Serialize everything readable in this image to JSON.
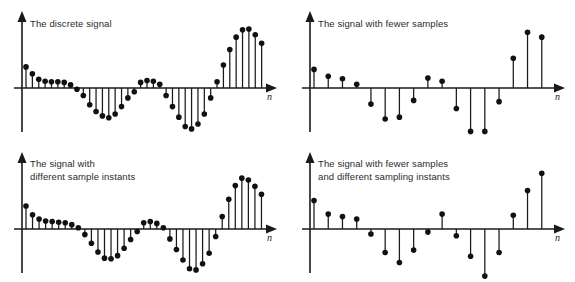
{
  "figure": {
    "background": "#ffffff",
    "stroke_color": "#1a1a1a",
    "marker_color": "#111111",
    "text_color": "#2b2b2b"
  },
  "panels": [
    {
      "id": "top-left",
      "caption": "The discrete signal",
      "axis_label": "n"
    },
    {
      "id": "top-right",
      "caption": "The signal with fewer samples",
      "axis_label": "n"
    },
    {
      "id": "bottom-left",
      "caption": "The signal with\ndifferent sample instants",
      "axis_label": "n"
    },
    {
      "id": "bottom-right",
      "caption": "The signal with fewer samples\nand different sampling instants",
      "axis_label": "n"
    }
  ],
  "chart_data": [
    {
      "type": "line",
      "plot_style": "stem",
      "panel": "top-left",
      "title": "The discrete signal",
      "xlabel": "n",
      "ylabel": "",
      "grid": false,
      "legend": "none",
      "xlim": [
        0,
        34
      ],
      "ylim": [
        -1.05,
        1.05
      ],
      "x": [
        1,
        2,
        3,
        4,
        5,
        6,
        7,
        8,
        9,
        10,
        11,
        12,
        13,
        14,
        15,
        16,
        17,
        18,
        19,
        20,
        21,
        22,
        23,
        24,
        25,
        26,
        27,
        28,
        29,
        30,
        31,
        32,
        33
      ],
      "values": [
        0.34,
        0.23,
        0.14,
        0.11,
        0.1,
        0.1,
        0.09,
        0.05,
        -0.02,
        -0.12,
        -0.27,
        -0.38,
        -0.45,
        -0.48,
        -0.42,
        -0.3,
        -0.16,
        -0.06,
        0.09,
        0.12,
        0.11,
        0.06,
        -0.12,
        -0.3,
        -0.47,
        -0.62,
        -0.66,
        -0.58,
        -0.42,
        -0.16,
        0.1,
        0.37,
        0.62
      ]
    },
    {
      "type": "line",
      "plot_style": "stem",
      "panel": "top-left-continued",
      "title": "The discrete signal (upper tail)",
      "xlabel": "n",
      "ylabel": "",
      "grid": false,
      "legend": "none",
      "x": [
        34,
        35,
        36,
        37,
        38
      ],
      "values": [
        0.82,
        0.94,
        0.95,
        0.86,
        0.72
      ]
    },
    {
      "type": "line",
      "plot_style": "stem",
      "panel": "top-right",
      "title": "The signal with fewer samples",
      "xlabel": "n",
      "ylabel": "",
      "grid": false,
      "legend": "none",
      "xlim": [
        0,
        20
      ],
      "ylim": [
        -1.05,
        1.05
      ],
      "x": [
        1,
        2,
        3,
        4,
        5,
        6,
        7,
        8,
        9,
        10,
        11,
        12,
        13,
        14,
        15,
        16,
        17
      ],
      "values": [
        0.3,
        0.19,
        0.15,
        0.06,
        -0.26,
        -0.5,
        -0.47,
        -0.2,
        0.16,
        0.11,
        -0.33,
        -0.7,
        -0.7,
        -0.22,
        0.48,
        0.9,
        0.82
      ]
    },
    {
      "type": "line",
      "plot_style": "stem",
      "panel": "bottom-left",
      "title": "The signal with different sample instants",
      "xlabel": "n",
      "ylabel": "",
      "grid": false,
      "legend": "none",
      "xlim": [
        0,
        34
      ],
      "ylim": [
        -1.05,
        1.05
      ],
      "x": [
        1,
        2,
        3,
        4,
        5,
        6,
        7,
        8,
        9,
        10,
        11,
        12,
        13,
        14,
        15,
        16,
        17,
        18,
        19,
        20,
        21,
        22,
        23,
        24,
        25,
        26,
        27,
        28,
        29,
        30,
        31,
        32,
        33,
        34,
        35,
        36,
        37
      ],
      "values": [
        0.37,
        0.23,
        0.16,
        0.13,
        0.12,
        0.11,
        0.1,
        0.07,
        0.02,
        -0.09,
        -0.23,
        -0.37,
        -0.47,
        -0.48,
        -0.43,
        -0.31,
        -0.17,
        -0.04,
        0.1,
        0.12,
        0.09,
        0.02,
        -0.16,
        -0.33,
        -0.5,
        -0.64,
        -0.66,
        -0.56,
        -0.39,
        -0.12,
        0.2,
        0.48,
        0.7,
        0.82,
        0.79,
        0.69,
        0.56
      ]
    },
    {
      "type": "line",
      "plot_style": "stem",
      "panel": "bottom-right",
      "title": "The signal with fewer samples and different sampling instants",
      "xlabel": "n",
      "ylabel": "",
      "grid": false,
      "legend": "none",
      "xlim": [
        0,
        20
      ],
      "ylim": [
        -1.05,
        1.05
      ],
      "x": [
        1,
        2,
        3,
        4,
        5,
        6,
        7,
        8,
        9,
        10,
        11,
        12,
        13,
        14,
        15,
        16,
        17
      ],
      "values": [
        0.46,
        0.24,
        0.2,
        0.16,
        -0.08,
        -0.38,
        -0.54,
        -0.34,
        -0.05,
        0.24,
        -0.11,
        -0.44,
        -0.76,
        -0.38,
        0.22,
        0.62,
        0.9
      ]
    }
  ],
  "geometry": {
    "note": "All panels share: y-axis at x=22px, baseline y=88px (top panels) / y=229px (bottom panels), axis extends to x=272px with arrowhead.",
    "baseline_top": 88,
    "baseline_bottom": 88,
    "y_axis_x": 22,
    "axis_right_x": 272,
    "amplitude_px": 62,
    "marker_radius": 2.8
  }
}
